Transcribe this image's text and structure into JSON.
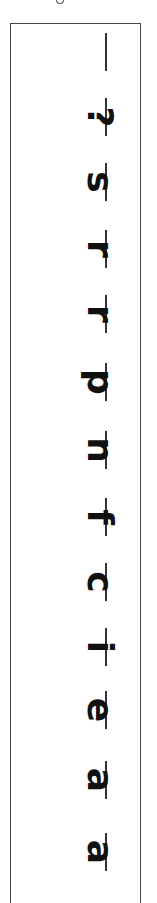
{
  "worksheet": {
    "orientation": "rotated-90-clockwise",
    "reading_order": "bottom-to-top",
    "colors": {
      "ink": "#111111",
      "border": "#444444",
      "background": "#ffffff"
    },
    "letters": [
      {
        "char": "",
        "top": 30
      },
      {
        "char": "?",
        "top": 95
      },
      {
        "char": "s",
        "top": 160
      },
      {
        "char": "r",
        "top": 227
      },
      {
        "char": "r",
        "top": 292
      },
      {
        "char": "p",
        "top": 360
      },
      {
        "char": "n",
        "top": 428
      },
      {
        "char": "f",
        "top": 495
      },
      {
        "char": "c",
        "top": 560
      },
      {
        "char": "i",
        "top": 625
      },
      {
        "char": "e",
        "top": 688
      },
      {
        "char": "a",
        "top": 758
      },
      {
        "char": "a",
        "top": 830
      }
    ]
  }
}
